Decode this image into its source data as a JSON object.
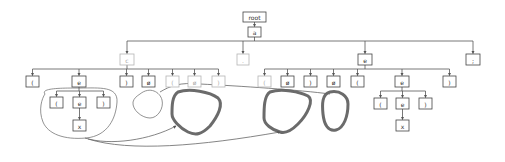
{
  "diagram": {
    "colors": {
      "node_stroke": "#444444",
      "node_dim_stroke": "#b5b5b5",
      "edge": "#555555",
      "blob_thin": "#777777",
      "blob_thick": "#6b6b6b"
    },
    "nodes": [
      {
        "id": "root",
        "label": "root",
        "x": 243,
        "y": 12,
        "w": 23,
        "h": 10,
        "dim": false
      },
      {
        "id": "a",
        "label": "a",
        "x": 248,
        "y": 27,
        "w": 13,
        "h": 10,
        "dim": false
      },
      {
        "id": "c",
        "label": "c",
        "x": 120,
        "y": 54,
        "w": 14,
        "h": 11,
        "dim": true
      },
      {
        "id": "dot",
        "label": ".",
        "x": 237,
        "y": 54,
        "w": 12,
        "h": 11,
        "dim": true
      },
      {
        "id": "e1",
        "label": "e",
        "x": 358,
        "y": 54,
        "w": 14,
        "h": 11,
        "dim": false
      },
      {
        "id": "semi",
        "label": ";",
        "x": 466,
        "y": 54,
        "w": 14,
        "h": 11,
        "dim": false
      },
      {
        "id": "c_1",
        "label": "(",
        "x": 26,
        "y": 76,
        "w": 13,
        "h": 11,
        "dim": false
      },
      {
        "id": "c_2",
        "label": "e",
        "x": 72,
        "y": 76,
        "w": 14,
        "h": 11,
        "dim": false
      },
      {
        "id": "c_3",
        "label": ")",
        "x": 120,
        "y": 76,
        "w": 13,
        "h": 11,
        "dim": false
      },
      {
        "id": "c_4",
        "label": "ø",
        "x": 142,
        "y": 76,
        "w": 13,
        "h": 11,
        "dim": false
      },
      {
        "id": "c_5",
        "label": "(",
        "x": 166,
        "y": 76,
        "w": 13,
        "h": 11,
        "dim": true
      },
      {
        "id": "c_6",
        "label": "ø",
        "x": 188,
        "y": 76,
        "w": 13,
        "h": 11,
        "dim": true
      },
      {
        "id": "c_7",
        "label": ")",
        "x": 212,
        "y": 76,
        "w": 13,
        "h": 11,
        "dim": true
      },
      {
        "id": "e_1",
        "label": "(",
        "x": 258,
        "y": 76,
        "w": 13,
        "h": 11,
        "dim": true
      },
      {
        "id": "e_2",
        "label": "ø",
        "x": 281,
        "y": 76,
        "w": 13,
        "h": 11,
        "dim": false
      },
      {
        "id": "e_3",
        "label": ")",
        "x": 304,
        "y": 76,
        "w": 13,
        "h": 11,
        "dim": false
      },
      {
        "id": "e_4",
        "label": "ø",
        "x": 327,
        "y": 76,
        "w": 13,
        "h": 11,
        "dim": false
      },
      {
        "id": "e_5",
        "label": "(",
        "x": 351,
        "y": 76,
        "w": 13,
        "h": 11,
        "dim": false
      },
      {
        "id": "e_6",
        "label": "e",
        "x": 395,
        "y": 76,
        "w": 14,
        "h": 11,
        "dim": false
      },
      {
        "id": "e_7",
        "label": ")",
        "x": 443,
        "y": 76,
        "w": 13,
        "h": 11,
        "dim": false
      },
      {
        "id": "l_1",
        "label": "(",
        "x": 50,
        "y": 97,
        "w": 13,
        "h": 11,
        "dim": false
      },
      {
        "id": "l_2",
        "label": "e",
        "x": 73,
        "y": 97,
        "w": 13,
        "h": 11,
        "dim": false
      },
      {
        "id": "l_3",
        "label": ")",
        "x": 97,
        "y": 97,
        "w": 13,
        "h": 11,
        "dim": false
      },
      {
        "id": "l_4",
        "label": "x",
        "x": 73,
        "y": 120,
        "w": 13,
        "h": 11,
        "dim": false
      },
      {
        "id": "r_1",
        "label": "(",
        "x": 374,
        "y": 98,
        "w": 13,
        "h": 11,
        "dim": false
      },
      {
        "id": "r_2",
        "label": "e",
        "x": 396,
        "y": 98,
        "w": 13,
        "h": 11,
        "dim": false
      },
      {
        "id": "r_3",
        "label": ")",
        "x": 419,
        "y": 98,
        "w": 13,
        "h": 11,
        "dim": false
      },
      {
        "id": "r_4",
        "label": "x",
        "x": 396,
        "y": 120,
        "w": 13,
        "h": 11,
        "dim": false
      }
    ],
    "edges": [
      {
        "from": "root",
        "to": [
          "a"
        ],
        "bar_y": 24
      },
      {
        "from": "a",
        "to": [
          "c",
          "dot",
          "e1",
          "semi"
        ],
        "bar_y": 41
      },
      {
        "from": "c",
        "to": [
          "c_1",
          "c_2",
          "c_3",
          "c_4",
          "c_5",
          "c_6",
          "c_7"
        ],
        "bar_y": 69
      },
      {
        "from": "e1",
        "to": [
          "e_1",
          "e_2",
          "e_3",
          "e_4",
          "e_5",
          "e_6",
          "e_7"
        ],
        "bar_y": 69
      },
      {
        "from": "c_2",
        "to": [
          "l_1",
          "l_2",
          "l_3"
        ],
        "bar_y": 91
      },
      {
        "from": "l_2",
        "to": [
          "l_4"
        ],
        "bar_y": 113
      },
      {
        "from": "e_6",
        "to": [
          "r_1",
          "r_2",
          "r_3"
        ],
        "bar_y": 91
      },
      {
        "from": "r_2",
        "to": [
          "r_4"
        ],
        "bar_y": 113
      }
    ],
    "blobs": [
      {
        "id": "group-left-subtree",
        "kind": "thin",
        "d": "M45,94 C40,88 62,88 80,88 C100,88 118,86 117,102 C116,118 108,136 86,138 C64,140 48,134 43,122 C38,110 42,98 45,94 Z"
      },
      {
        "id": "group-small-round",
        "kind": "thin",
        "d": "M140,94 C150,86 160,92 162,100 C164,108 158,118 150,118 C142,118 132,110 133,102 C134,98 137,96 140,94 Z"
      },
      {
        "id": "group-thick-1",
        "kind": "thick",
        "d": "M178,92 C190,88 210,92 218,98 C224,104 218,116 210,126 C202,134 196,136 188,132 C180,128 172,120 172,114 C172,106 172,96 178,92 Z"
      },
      {
        "id": "group-thick-2",
        "kind": "thick",
        "d": "M270,92 C282,88 300,92 308,96 C314,100 308,114 298,124 C292,130 286,134 280,132 C272,130 264,124 264,118 C264,108 264,96 270,92 Z"
      },
      {
        "id": "group-thick-3",
        "kind": "thick",
        "d": "M330,92 C340,90 348,96 348,104 C348,116 344,128 336,130 C328,132 324,124 323,114 C322,104 322,94 330,92 Z"
      }
    ],
    "connectors": [
      {
        "id": "link-upper",
        "d": "M160,92 C170,86 180,82 200,84 C240,86 300,90 330,94",
        "arrow": false
      },
      {
        "id": "link-to-thick-1",
        "d": "M85,138 C110,146 150,140 176,126",
        "arrow": true
      },
      {
        "id": "link-to-thick-2",
        "d": "M88,139 C130,152 200,146 280,132",
        "arrow": true
      }
    ]
  }
}
